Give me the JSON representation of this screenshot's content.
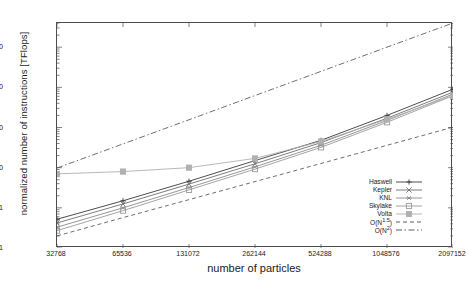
{
  "chart_data": {
    "type": "line",
    "title": "",
    "xlabel": "number of particles",
    "ylabel": "normalized number of instructions [TFlops]",
    "xscale": "log2",
    "yscale": "log10",
    "xlim": [
      32768,
      2097152
    ],
    "ylim": [
      0.1,
      40000
    ],
    "grid": false,
    "legend_position": "bottom-right",
    "xticks": [
      "32768",
      "65536",
      "131072",
      "262144",
      "524288",
      "1048576",
      "2097152"
    ],
    "x": [
      32768,
      65536,
      131072,
      262144,
      524288,
      1048576,
      2097152
    ],
    "yticks": [
      "0.1",
      "1",
      "10",
      "100",
      "1000",
      "10000"
    ],
    "ytickvalues": [
      0.1,
      1,
      10,
      100,
      1000,
      10000
    ],
    "series": [
      {
        "name": "Haswell",
        "marker": "plus",
        "dash": "solid",
        "color": "#3a3a3a",
        "values": [
          0.52,
          1.5,
          4.6,
          15.0,
          48.0,
          200.0,
          900.0
        ]
      },
      {
        "name": "Kepler",
        "marker": "cross",
        "dash": "solid",
        "color": "#6e6e6e",
        "values": [
          0.42,
          1.25,
          3.9,
          12.5,
          42.0,
          170.0,
          760.0
        ]
      },
      {
        "name": "KNL",
        "marker": "asterisk",
        "dash": "solid",
        "color": "#8a8a8a",
        "values": [
          0.33,
          1.0,
          3.2,
          10.5,
          36.0,
          150.0,
          680.0
        ]
      },
      {
        "name": "Skylake",
        "marker": "square",
        "dash": "solid",
        "color": "#9a9a9a",
        "values": [
          0.27,
          0.85,
          2.8,
          9.2,
          32.0,
          135.0,
          620.0
        ]
      },
      {
        "name": "Volta",
        "marker": "fsquare",
        "dash": "solid",
        "color": "#b0b0b0",
        "values": [
          7.0,
          8.0,
          10.0,
          17.0,
          45.0,
          160.0,
          620.0
        ]
      },
      {
        "name": "O(N^1.5)",
        "marker": "none",
        "dash": "dashed",
        "color": "#4a4a4a",
        "values": [
          0.2,
          0.57,
          1.6,
          4.5,
          12.7,
          36.0,
          102.0
        ]
      },
      {
        "name": "O(N^2)",
        "marker": "none",
        "dash": "dashdot",
        "color": "#4a4a4a",
        "values": [
          9.8,
          39.0,
          156.0,
          625.0,
          2500.0,
          10000.0,
          40000.0
        ]
      }
    ],
    "legend": [
      {
        "label": "Haswell",
        "marker": "plus",
        "dash": "solid"
      },
      {
        "label": "Kepler",
        "marker": "cross",
        "dash": "solid"
      },
      {
        "label": "KNL",
        "marker": "asterisk",
        "dash": "solid"
      },
      {
        "label": "Skylake",
        "marker": "square",
        "dash": "solid"
      },
      {
        "label": "Volta",
        "marker": "fsquare",
        "dash": "solid"
      },
      {
        "label": "O(N^1.5)",
        "marker": "none",
        "dash": "dashed"
      },
      {
        "label": "O(N^2)",
        "marker": "none",
        "dash": "dashdot"
      }
    ],
    "legend_labels_html": [
      "Haswell",
      "Kepler",
      "KNL",
      "Skylake",
      "Volta",
      "O(N<sup>1.5</sup>)",
      "O(N<sup>2</sup>)"
    ]
  }
}
